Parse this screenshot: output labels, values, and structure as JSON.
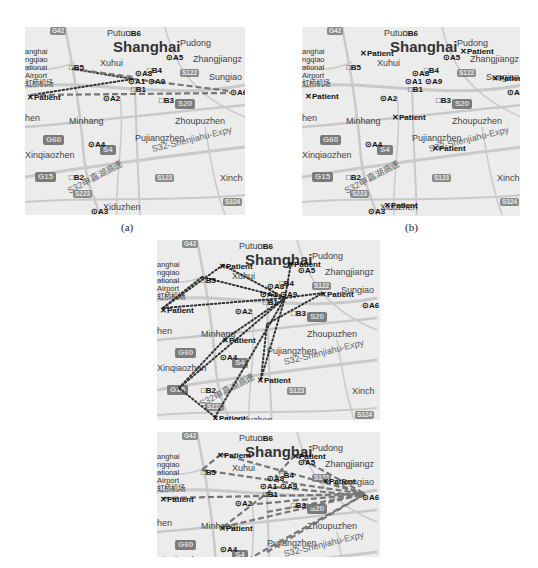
{
  "figure": {
    "captions": {
      "a": "(a)",
      "b": "(b)"
    }
  },
  "map_labels": {
    "putuo": "Putuo",
    "shanghai": "Shanghai",
    "pudong": "Pudong",
    "xuhui": "Xuhui",
    "zhangjiang": "Zhangjiangz",
    "sungiao": "Sungiao",
    "minhang": "Minhang",
    "zhoupuzhen": "Zhoupuzhen",
    "pujiangzhen": "Pujiangzhen",
    "expy": "S32-Shenjiahu-Expy",
    "expy_cn": "S32申嘉湖高速",
    "xinqiaozhen": "Xinqiaozhen",
    "xinch": "Xinch",
    "xiduzhen": "Xiduzhen",
    "hen": "hen",
    "airport_1": "anghai",
    "airport_2": "ngqiao",
    "airport_3": "ational",
    "airport_4": "Airport",
    "airport_cn": "虹桥机场"
  },
  "road_shields": {
    "g42": "G42",
    "s122": "S122",
    "s20": "S20",
    "g60": "G60",
    "s4": "S4",
    "g15": "G15",
    "s123": "S123",
    "s223": "S223",
    "s324": "S324"
  },
  "markers": {
    "A1": "A1",
    "A2": "A2",
    "A3": "A3",
    "A4": "A4",
    "A5": "A5",
    "A6": "A6",
    "A8": "A8",
    "A9": "A9",
    "B1": "B1",
    "B2": "B2",
    "B3": "B3",
    "B4": "B4",
    "B5": "B5",
    "B6": "B6",
    "patient": "Patient"
  },
  "panels": [
    {
      "id": "a",
      "patients": [
        [
          2,
          67
        ]
      ],
      "links_dotted": [
        [
          6,
          68,
          108,
          52
        ],
        [
          48,
          42,
          108,
          52
        ]
      ],
      "links_dashed": [
        [
          48,
          42,
          108,
          50
        ],
        [
          108,
          52,
          205,
          64
        ],
        [
          6,
          68,
          205,
          66
        ]
      ]
    },
    {
      "id": "b",
      "patients": [
        [
          58,
          23
        ],
        [
          158,
          21
        ],
        [
          3,
          66
        ],
        [
          90,
          87
        ],
        [
          130,
          118
        ],
        [
          82,
          175
        ],
        [
          190,
          48
        ]
      ],
      "links_dotted": [],
      "links_dashed": []
    },
    {
      "id": "c",
      "patients": [
        [
          62,
          23
        ],
        [
          130,
          21
        ],
        [
          3,
          67
        ],
        [
          65,
          97
        ],
        [
          100,
          137
        ],
        [
          55,
          175
        ],
        [
          163,
          51
        ]
      ],
      "links_dotted": [
        [
          66,
          25,
          128,
          58
        ],
        [
          134,
          23,
          128,
          58
        ],
        [
          6,
          68,
          128,
          58
        ],
        [
          68,
          99,
          128,
          58
        ],
        [
          104,
          139,
          128,
          58
        ],
        [
          58,
          177,
          128,
          58
        ],
        [
          166,
          53,
          128,
          58
        ],
        [
          45,
          37,
          128,
          58
        ],
        [
          22,
          148,
          128,
          58
        ],
        [
          58,
          177,
          22,
          148
        ],
        [
          66,
          25,
          6,
          68
        ],
        [
          6,
          68,
          45,
          37
        ],
        [
          104,
          139,
          110,
          84
        ],
        [
          22,
          148,
          68,
          99
        ],
        [
          110,
          84,
          166,
          53
        ]
      ],
      "links_dashed": []
    },
    {
      "id": "d",
      "patients": [
        [
          60,
          20
        ],
        [
          135,
          21
        ],
        [
          3,
          64
        ],
        [
          62,
          93
        ],
        [
          165,
          46
        ]
      ],
      "links_dotted": [],
      "links_dashed": [
        [
          64,
          22,
          45,
          38
        ],
        [
          64,
          22,
          208,
          62
        ],
        [
          138,
          23,
          208,
          62
        ],
        [
          138,
          23,
          118,
          45
        ],
        [
          6,
          66,
          208,
          62
        ],
        [
          45,
          38,
          208,
          62
        ],
        [
          66,
          95,
          208,
          62
        ],
        [
          66,
          95,
          118,
          55
        ],
        [
          110,
          120,
          208,
          62
        ],
        [
          90,
          128,
          208,
          62
        ],
        [
          110,
          80,
          208,
          62
        ],
        [
          168,
          48,
          208,
          62
        ],
        [
          118,
          55,
          208,
          64
        ],
        [
          100,
          72,
          208,
          62
        ]
      ]
    }
  ]
}
